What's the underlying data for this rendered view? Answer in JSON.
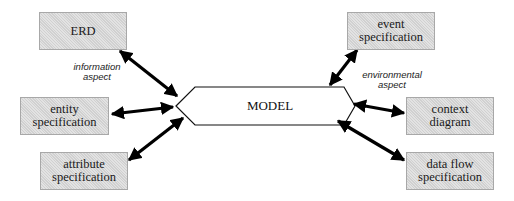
{
  "diagram": {
    "center": {
      "label": "MODEL",
      "shape": "hexagon"
    },
    "boxes": {
      "erd": {
        "lines": [
          "ERD"
        ]
      },
      "entity_specification": {
        "lines": [
          "entity",
          "specification"
        ]
      },
      "attribute_specification": {
        "lines": [
          "attribute",
          "specification"
        ]
      },
      "event_specification": {
        "lines": [
          "event",
          "specification"
        ]
      },
      "context_diagram": {
        "lines": [
          "context",
          "diagram"
        ]
      },
      "data_flow_specification": {
        "lines": [
          "data flow",
          "specification"
        ]
      }
    },
    "aspect_labels": {
      "information": {
        "lines": [
          "information",
          "aspect"
        ]
      },
      "environmental": {
        "lines": [
          "environmental",
          "aspect"
        ]
      }
    },
    "colors": {
      "box_fill": "#d9d9d9",
      "box_border": "#a8a8a8",
      "arrow": "#000000",
      "background": "#ffffff"
    }
  }
}
